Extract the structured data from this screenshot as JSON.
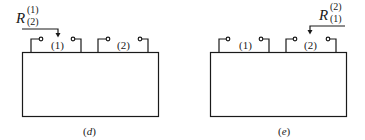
{
  "panels": [
    {
      "id": "d",
      "caption": "(d)",
      "caption_letter": "d",
      "ports": [
        {
          "label": "(1)"
        },
        {
          "label": "(2)"
        }
      ],
      "reflection": {
        "symbol": "R",
        "superscript": "(1)",
        "subscript": "(2)",
        "arrow_to_port": "(1)"
      }
    },
    {
      "id": "e",
      "caption": "(e)",
      "caption_letter": "e",
      "ports": [
        {
          "label": "(1)"
        },
        {
          "label": "(2)"
        }
      ],
      "reflection": {
        "symbol": "R",
        "superscript": "(2)",
        "subscript": "(1)",
        "arrow_to_port": "(2)"
      }
    }
  ],
  "colors": {
    "stroke": "#1a1a1a",
    "background": "#ffffff"
  }
}
